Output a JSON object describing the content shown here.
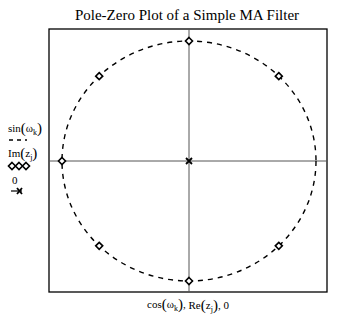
{
  "chart_data": {
    "type": "scatter",
    "title": "Pole-Zero Plot of a Simple MA Filter",
    "xlabel": "cos(ω_k), Re(z_j), 0",
    "ylabel": "",
    "xlim": [
      -1.1,
      1.1
    ],
    "ylim": [
      -1.1,
      1.1
    ],
    "grid": false,
    "legend_position": "left",
    "axes_through_origin": true,
    "series": [
      {
        "name": "sin(ω_k)",
        "legend_label": "sin(ωk)",
        "style": "dashed-line",
        "description": "unit circle",
        "x": "cos(ω_k)",
        "y": "sin(ω_k)"
      },
      {
        "name": "Im(z_j)",
        "legend_label": "Im(zj)",
        "style": "open-diamond-markers",
        "description": "zeros",
        "points": [
          [
            0.7071,
            0.7071
          ],
          [
            0,
            1
          ],
          [
            -0.7071,
            0.7071
          ],
          [
            -1,
            0
          ],
          [
            -0.7071,
            -0.7071
          ],
          [
            0,
            -1
          ],
          [
            0.7071,
            -0.7071
          ]
        ]
      },
      {
        "name": "0",
        "legend_label": "0",
        "style": "x-marker",
        "description": "pole at origin",
        "points": [
          [
            0,
            0
          ]
        ]
      }
    ]
  },
  "labels": {
    "title": "Pole-Zero Plot of a Simple MA Filter",
    "legend_sin": "sin",
    "legend_sin_sub": "k",
    "legend_im": "Im",
    "legend_im_sub": "j",
    "legend_zero": "0",
    "xlabel_cos": "cos",
    "xlabel_re": "Re",
    "xlabel_tail": ", 0",
    "omega": "ω",
    "z": "z"
  }
}
